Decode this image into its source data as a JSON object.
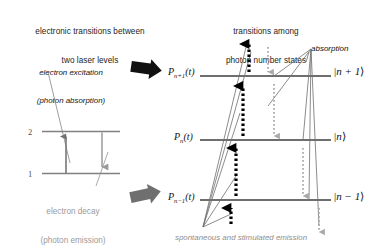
{
  "figure": {
    "type": "physics-energy-level-diagram",
    "background_color": "#ffffff"
  },
  "left_panel": {
    "title_line1": "electronic transitions between",
    "title_line2": "two laser levels",
    "excitation_label_line1": "electron excitation",
    "excitation_label_line2": "(photon absorption)",
    "decay_label_line1": "electron decay",
    "decay_label_line2": "(photon emission)",
    "level_upper": "2",
    "level_lower": "1",
    "excitation_arrow_direction": "up",
    "decay_arrow_direction": "down",
    "level_line_color": "#808080",
    "excitation_arrow_color": "#6e6e6e",
    "decay_arrow_color": "#9a9a9a"
  },
  "right_panel": {
    "title_line1": "transitions among",
    "title_line2": "photon number states",
    "absorption_label": "absorption",
    "bottom_caption": "spontaneous and stimulated emission",
    "levels": [
      {
        "prob_label_P": "P",
        "prob_label_sub": "n+1",
        "prob_label_t": "(t)",
        "ket_open": "|",
        "ket_value": "n + 1",
        "ket_close": "⟩"
      },
      {
        "prob_label_P": "P",
        "prob_label_sub": "n",
        "prob_label_t": "(t)",
        "ket_open": "|",
        "ket_value": "n",
        "ket_close": "⟩"
      },
      {
        "prob_label_P": "P",
        "prob_label_sub": "n−1",
        "prob_label_t": "(t)",
        "ket_open": "|",
        "ket_value": "n − 1",
        "ket_close": "⟩"
      }
    ],
    "level_line_color": "#6e6e6e",
    "emission_arrow_style": "dotted-bold-black-up",
    "absorption_arrow_style": "dotted-gray-down",
    "fan_line_color": "#6e6e6e"
  },
  "connector_arrows": {
    "top_arrow_name": "block-arrow-right-top",
    "bottom_arrow_name": "block-arrow-right-bottom",
    "color": "#111111"
  }
}
